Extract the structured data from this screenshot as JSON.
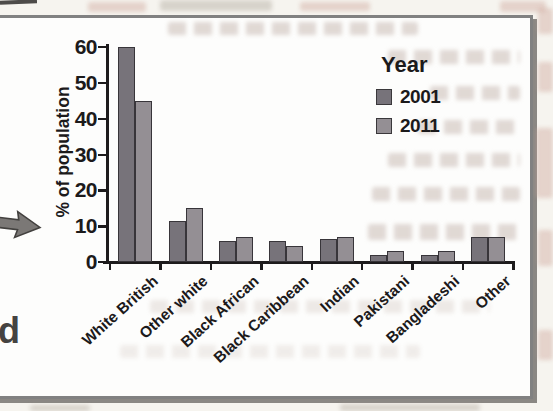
{
  "chart_data": {
    "type": "bar",
    "categories": [
      "White British",
      "Other white",
      "Black African",
      "Black Caribbean",
      "Indian",
      "Pakistani",
      "Bangladeshi",
      "Other"
    ],
    "series": [
      {
        "name": "2001",
        "color": "#77737a",
        "values": [
          60,
          11.5,
          6,
          6,
          6.5,
          2,
          2,
          7
        ]
      },
      {
        "name": "2011",
        "color": "#948f94",
        "values": [
          45,
          15,
          7,
          4.5,
          7,
          3,
          3,
          7
        ]
      }
    ],
    "ylabel": "% of population",
    "yticks": [
      0,
      10,
      20,
      30,
      40,
      50,
      60
    ],
    "ylim": [
      0,
      60
    ],
    "grid": false,
    "legend_title": "Year",
    "legend_position": "top-right"
  },
  "legend": {
    "title": "Year",
    "items": [
      {
        "label": "2001",
        "color": "#77737a"
      },
      {
        "label": "2011",
        "color": "#948f94"
      }
    ]
  },
  "page": {
    "cut_letter": "d"
  },
  "colors": {
    "axis": "#1d1b1c",
    "box_background": "#fdfdfc",
    "box_border": "#818181",
    "page_background": "#f6f4ef"
  }
}
